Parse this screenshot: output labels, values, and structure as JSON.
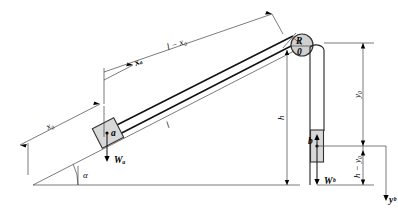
{
  "figure": {
    "colors": {
      "line": "#111111",
      "thin_line": "#444444",
      "block_fill": "#d8d8d8",
      "pulley_fill": "#d0d0d0",
      "background": "#ffffff"
    }
  },
  "labels": {
    "length_total": "l",
    "length_remaining": "l − x₀",
    "position_a": "x₀",
    "displacement_a": "xₐ",
    "angle": "α",
    "block_a": "a",
    "weight_a": "Wₐ",
    "block_b": "b",
    "weight_b": "Wᵇ",
    "height": "h",
    "pulley_radius": "R",
    "pulley_center": "0",
    "position_b": "y₀",
    "remaining_b": "h − y₀",
    "axis_b": "yᵇ"
  },
  "geometry": {
    "incline_angle_deg": 27,
    "base_line": {
      "x1": 33,
      "y1": 185,
      "x2": 300,
      "y2": 185
    },
    "incline_line": {
      "x1": 33,
      "y1": 185,
      "x2": 300,
      "y2": 48
    },
    "pulley": {
      "cx": 302,
      "cy": 45,
      "r": 11
    },
    "block_a": {
      "cx": 108,
      "cy": 133,
      "w": 24,
      "h": 22
    },
    "block_b": {
      "cx": 317,
      "cy": 146,
      "w": 13,
      "h": 32
    },
    "rope_left_x": 310,
    "rope_right_x": 324,
    "dim_right_x": 372,
    "axis_y_x": 387
  },
  "annotations": [
    {
      "name": "total-length",
      "text": "l",
      "note": "rod/incline total length measured along slope"
    },
    {
      "name": "remaining-length",
      "text": "l − x₀",
      "note": "distance from block a up to pulley"
    },
    {
      "name": "initial-position",
      "text": "x₀",
      "note": "initial distance of block a from base of incline"
    },
    {
      "name": "displacement",
      "text": "xₐ",
      "note": "displacement of block a along incline"
    },
    {
      "name": "incline-angle",
      "text": "α",
      "note": "angle of incline with horizontal"
    },
    {
      "name": "weight-a",
      "text": "Wₐ",
      "note": "weight force of block a, directed downward"
    },
    {
      "name": "weight-b",
      "text": "Wᵇ",
      "note": "weight force of block b, directed downward"
    },
    {
      "name": "pulley-height",
      "text": "h",
      "note": "vertical height of pulley above base"
    },
    {
      "name": "pulley-radius",
      "text": "R",
      "note": "pulley radius"
    },
    {
      "name": "pulley-origin",
      "text": "0",
      "note": "pulley center / origin"
    },
    {
      "name": "b-position",
      "text": "y₀",
      "note": "initial vertical position of block b below pulley"
    },
    {
      "name": "b-remaining",
      "text": "h − y₀",
      "note": "distance of block b above base"
    },
    {
      "name": "b-axis",
      "text": "yᵇ",
      "note": "downward positive axis for block b"
    }
  ]
}
